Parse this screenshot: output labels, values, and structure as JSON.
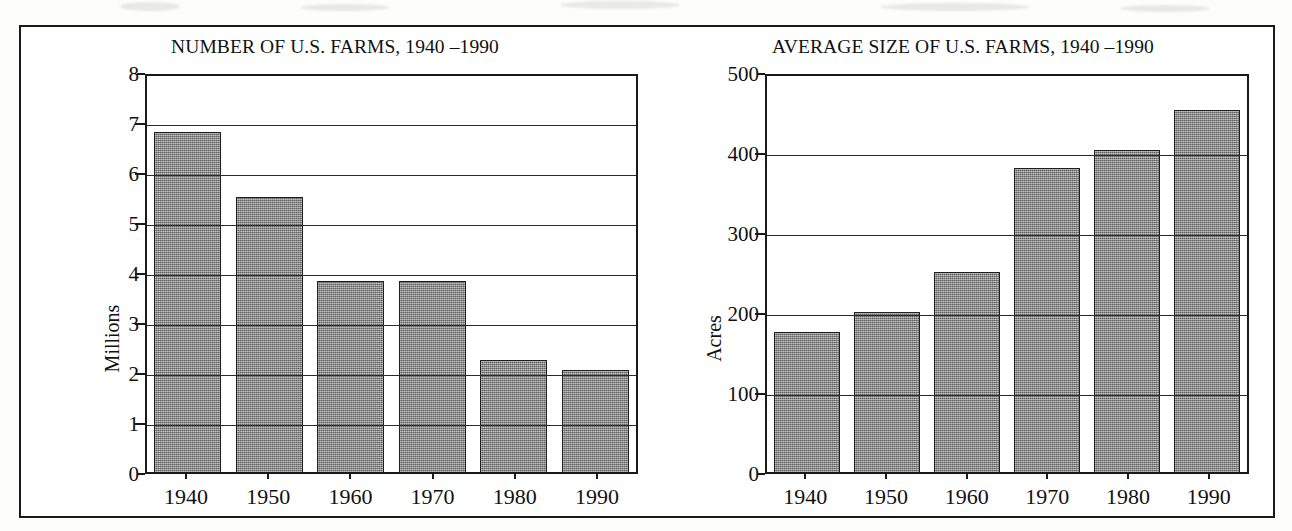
{
  "figure": {
    "panels": [
      {
        "id": "left",
        "title": "NUMBER OF U.S. FARMS, 1940 –1990",
        "y_axis_label": "Millions",
        "y_ticks": [
          "0",
          "1",
          "2",
          "3",
          "4",
          "5",
          "6",
          "7",
          "8"
        ],
        "x_ticks": [
          "1940",
          "1950",
          "1960",
          "1970",
          "1980",
          "1990"
        ]
      },
      {
        "id": "right",
        "title": "AVERAGE SIZE OF U.S. FARMS, 1940 –1990",
        "y_axis_label": "Acres",
        "y_ticks": [
          "0",
          "100",
          "200",
          "300",
          "400",
          "500"
        ],
        "x_ticks": [
          "1940",
          "1950",
          "1960",
          "1970",
          "1980",
          "1990"
        ]
      }
    ]
  },
  "chart_data": [
    {
      "type": "bar",
      "title": "NUMBER OF U.S. FARMS, 1940 –1990",
      "xlabel": "",
      "ylabel": "Millions",
      "categories": [
        "1940",
        "1950",
        "1960",
        "1970",
        "1980",
        "1990"
      ],
      "values": [
        6.8,
        5.5,
        3.83,
        3.83,
        2.25,
        2.05
      ],
      "ylim": [
        0,
        8
      ],
      "ytick_values": [
        0,
        1,
        2,
        3,
        4,
        5,
        6,
        7,
        8
      ],
      "grid": true,
      "gridlines_at": [
        1,
        2,
        3,
        4,
        5,
        6,
        7
      ],
      "legend": "none",
      "bar_color": "#8a8a8a",
      "bar_edge_color": "#1f1f1f"
    },
    {
      "type": "bar",
      "title": "AVERAGE SIZE OF U.S. FARMS, 1940 –1990",
      "xlabel": "",
      "ylabel": "Acres",
      "categories": [
        "1940",
        "1950",
        "1960",
        "1970",
        "1980",
        "1990"
      ],
      "values": [
        175,
        200,
        250,
        380,
        402,
        452
      ],
      "ylim": [
        0,
        500
      ],
      "ytick_values": [
        0,
        100,
        200,
        300,
        400,
        500
      ],
      "grid": true,
      "gridlines_at": [
        100,
        200,
        300,
        400
      ],
      "legend": "none",
      "bar_color": "#8a8a8a",
      "bar_edge_color": "#1f1f1f"
    }
  ]
}
